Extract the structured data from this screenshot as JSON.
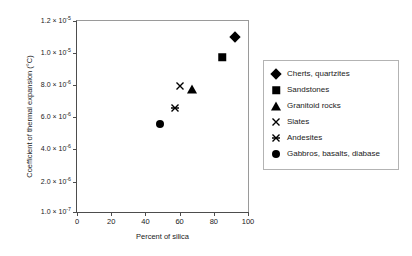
{
  "chart_data": {
    "type": "scatter",
    "title": "",
    "xlabel": "Percent of silica",
    "ylabel": "Coefficient of thermal expansion (°C)",
    "xlim": [
      0,
      100
    ],
    "ylim": [
      1e-07,
      1.2e-05
    ],
    "grid": false,
    "legend_position": "right-outside",
    "xticks": [
      {
        "value": 0,
        "label": "0"
      },
      {
        "value": 20,
        "label": "20"
      },
      {
        "value": 40,
        "label": "40"
      },
      {
        "value": 60,
        "label": "60"
      },
      {
        "value": 80,
        "label": "80"
      },
      {
        "value": 100,
        "label": "100"
      }
    ],
    "yticks": [
      {
        "value": 1e-07,
        "mantissa": "1.0 × 10",
        "exponent": "-7",
        "label": "1.0 × 10⁻⁷"
      },
      {
        "value": 2e-06,
        "mantissa": "2.0 × 10",
        "exponent": "-6",
        "label": "2.0 × 10⁻⁶"
      },
      {
        "value": 4e-06,
        "mantissa": "4.0 × 10",
        "exponent": "-6",
        "label": "4.0 × 10⁻⁶"
      },
      {
        "value": 6e-06,
        "mantissa": "6.0 × 10",
        "exponent": "-6",
        "label": "6.0 × 10⁻⁶"
      },
      {
        "value": 8e-06,
        "mantissa": "8.0 × 10",
        "exponent": "-6",
        "label": "8.0 × 10⁻⁶"
      },
      {
        "value": 1e-05,
        "mantissa": "1.0 × 10",
        "exponent": "-5",
        "label": "1.0 × 10⁻⁵"
      },
      {
        "value": 1.2e-05,
        "mantissa": "1.2 × 10",
        "exponent": "-5",
        "label": "1.2 × 10⁻⁵"
      }
    ],
    "series": [
      {
        "name": "Cherts, quartzites",
        "marker": "diamond",
        "color": "#000000",
        "points": [
          {
            "x": 92.5,
            "y": 1.1e-05
          }
        ]
      },
      {
        "name": "Sandstones",
        "marker": "square",
        "color": "#000000",
        "points": [
          {
            "x": 85.0,
            "y": 9.75e-06
          }
        ]
      },
      {
        "name": "Granitoid rocks",
        "marker": "triangle",
        "color": "#000000",
        "points": [
          {
            "x": 67.5,
            "y": 7.75e-06
          }
        ]
      },
      {
        "name": "Slates",
        "marker": "cross",
        "color": "#000000",
        "points": [
          {
            "x": 60.0,
            "y": 7.95e-06
          }
        ]
      },
      {
        "name": "Andesites",
        "marker": "cross-bar",
        "color": "#000000",
        "points": [
          {
            "x": 57.5,
            "y": 6.6e-06
          }
        ]
      },
      {
        "name": "Gabbros, basalts, diabase",
        "marker": "circle",
        "color": "#000000",
        "points": [
          {
            "x": 48.5,
            "y": 5.6e-06
          }
        ]
      }
    ]
  }
}
